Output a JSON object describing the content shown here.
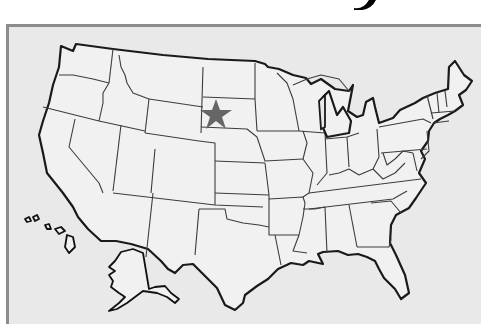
{
  "map": {
    "title_fragment": "y",
    "subject": "United States",
    "highlighted_state": "South Dakota",
    "marker": {
      "type": "star",
      "color": "#666666",
      "x": 213,
      "y": 110
    },
    "insets": [
      "Alaska",
      "Hawaii"
    ],
    "colors": {
      "background": "#e9e9e9",
      "land": "#f1f1f1",
      "border": "#1a1a1a",
      "frame": "#8c8c8c"
    }
  }
}
